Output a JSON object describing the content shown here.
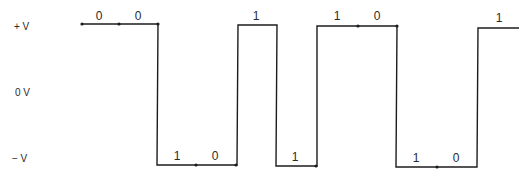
{
  "diagram": {
    "type": "digital-waveform",
    "colors": {
      "line": "#1c1c1c",
      "text": "#2a2a2a",
      "background": "#ffffff"
    },
    "axis_labels": [
      {
        "text": "+ V",
        "x": 14,
        "y": 30,
        "level": "high"
      },
      {
        "text": "0 V",
        "x": 15,
        "y": 96,
        "level": "zero"
      },
      {
        "text": "− V",
        "x": 12,
        "y": 162,
        "level": "low"
      }
    ],
    "levels": {
      "high_y": 25,
      "low_y": 166
    },
    "waveform_points": [
      [
        82,
        24
      ],
      [
        158,
        24
      ],
      [
        157,
        165
      ],
      [
        237,
        165
      ],
      [
        238,
        25
      ],
      [
        277,
        25
      ],
      [
        276,
        166
      ],
      [
        317,
        166
      ],
      [
        317,
        26
      ],
      [
        397,
        26
      ],
      [
        396,
        167
      ],
      [
        477,
        167
      ],
      [
        478,
        28
      ],
      [
        519,
        28
      ]
    ],
    "dots": [
      [
        82,
        24
      ],
      [
        119,
        24
      ],
      [
        158,
        24
      ],
      [
        196,
        165
      ],
      [
        236,
        165
      ],
      [
        316,
        166
      ],
      [
        358,
        26
      ],
      [
        397,
        26
      ],
      [
        437,
        167
      ]
    ],
    "bits": [
      {
        "text": "0",
        "x": 99,
        "y": 20
      },
      {
        "text": "0",
        "x": 138,
        "y": 20
      },
      {
        "text": "1",
        "x": 177,
        "y": 160
      },
      {
        "text": "0",
        "x": 215,
        "y": 160
      },
      {
        "text": "1",
        "x": 256,
        "y": 20
      },
      {
        "text": "1",
        "x": 295,
        "y": 161
      },
      {
        "text": "1",
        "x": 337,
        "y": 20
      },
      {
        "text": "0",
        "x": 377,
        "y": 20
      },
      {
        "text": "1",
        "x": 416,
        "y": 162
      },
      {
        "text": "0",
        "x": 456,
        "y": 162
      },
      {
        "text": "1",
        "x": 499,
        "y": 22
      }
    ],
    "bit_sequence": "00101110101"
  }
}
